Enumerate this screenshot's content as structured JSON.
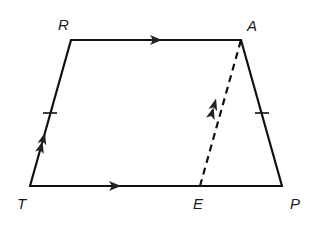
{
  "diagram": {
    "type": "geometry-figure",
    "colors": {
      "stroke": "#111111",
      "label": "#1a1a1a",
      "background": "#ffffff"
    },
    "vertices": [
      {
        "id": "R",
        "label": "R",
        "x": 71,
        "y": 40
      },
      {
        "id": "A",
        "label": "A",
        "x": 241,
        "y": 40
      },
      {
        "id": "T",
        "label": "T",
        "x": 30,
        "y": 186
      },
      {
        "id": "E",
        "label": "E",
        "x": 200,
        "y": 186
      },
      {
        "id": "P",
        "label": "P",
        "x": 282,
        "y": 186
      }
    ],
    "segments": [
      {
        "from": "R",
        "to": "A",
        "style": "solid",
        "marking": "single-arrow"
      },
      {
        "from": "T",
        "to": "P",
        "style": "solid",
        "marking": "single-arrow"
      },
      {
        "from": "T",
        "to": "R",
        "style": "solid",
        "marking": "double-arrow + single-tick"
      },
      {
        "from": "A",
        "to": "P",
        "style": "solid",
        "marking": "single-tick"
      },
      {
        "from": "E",
        "to": "A",
        "style": "dashed",
        "marking": "double-arrow"
      }
    ],
    "labels": {
      "R": "R",
      "A": "A",
      "T": "T",
      "E": "E",
      "P": "P"
    }
  }
}
